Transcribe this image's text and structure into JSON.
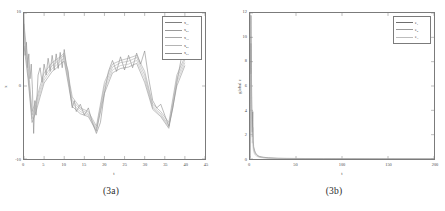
{
  "figure": {
    "panels": [
      {
        "id": "panel-3a",
        "caption": "(3a)",
        "chart_data": {
          "type": "line",
          "title": "",
          "xlabel": "t",
          "ylabel": "x",
          "xlim": [
            0,
            45
          ],
          "ylim": [
            -10,
            10
          ],
          "xticks": [
            0,
            5,
            10,
            15,
            20,
            25,
            30,
            35,
            40,
            45
          ],
          "xticklabels": [
            "0",
            "5",
            "10",
            "15",
            "20",
            "25",
            "30",
            "35",
            "40",
            "45"
          ],
          "yticks": [
            -10,
            0,
            10
          ],
          "yticklabels": [
            "-10",
            "0",
            "10"
          ],
          "grid": false,
          "legend_position": "upper right",
          "series": [
            {
              "name": "x_11",
              "label_base": "x",
              "label_sub": "11",
              "color": "#7f7f7f",
              "x": [
                0,
                0.3,
                0.6,
                0.9,
                1.2,
                1.5,
                1.8,
                2.1,
                2.4,
                2.7,
                3.0,
                3.5,
                4.0,
                4.5,
                5.0,
                5.5,
                6.0,
                6.5,
                7.0,
                7.5,
                8.0,
                8.5,
                9.0,
                9.5,
                10.0,
                10.5,
                11.0,
                11.5,
                12.0,
                12.5,
                13.0,
                14.0,
                15.0,
                16.0,
                17.0,
                18.0,
                19.0,
                20.0,
                21.0,
                22.0,
                23.0,
                24.0,
                25.0,
                26.0,
                27.0,
                28.0,
                29.0,
                30.0,
                31.0,
                32.0,
                33.0,
                34.0,
                35.0,
                36.0,
                37.0,
                38.0,
                39.0,
                40.0
              ],
              "y": [
                9.6,
                4.2,
                6.0,
                2.5,
                4.4,
                1.0,
                3.0,
                -0.5,
                -6.5,
                -2.0,
                -4.0,
                1.5,
                2.5,
                0.5,
                3.0,
                1.5,
                3.8,
                2.0,
                4.2,
                2.2,
                4.4,
                2.4,
                4.6,
                2.5,
                5.0,
                3.0,
                2.0,
                -1.0,
                -3.0,
                -2.0,
                -3.5,
                -2.5,
                -4.0,
                -3.0,
                -5.0,
                -6.5,
                -5.0,
                -1.0,
                2.0,
                3.5,
                2.0,
                4.0,
                2.2,
                4.2,
                2.5,
                4.5,
                3.0,
                4.8,
                1.0,
                -2.0,
                -3.0,
                -2.5,
                -4.0,
                -5.5,
                -3.0,
                0.5,
                3.5,
                4.2
              ]
            },
            {
              "name": "x_21",
              "label_base": "x",
              "label_sub": "21",
              "color": "#9a9a9a",
              "x": [
                0,
                1,
                2,
                3,
                4,
                5,
                6,
                7,
                8,
                9,
                10,
                12,
                14,
                16,
                18,
                20,
                22,
                24,
                26,
                28,
                30,
                32,
                34,
                36,
                38,
                40
              ],
              "y": [
                8.5,
                3.0,
                -3.5,
                -2.0,
                0.0,
                1.8,
                2.5,
                3.2,
                3.6,
                4.0,
                4.5,
                -1.5,
                -3.0,
                -3.5,
                -5.5,
                0.5,
                3.0,
                3.5,
                3.8,
                4.2,
                2.0,
                -2.5,
                -3.5,
                -5.0,
                1.5,
                4.0
              ]
            },
            {
              "name": "x_31",
              "label_base": "x",
              "label_sub": "31",
              "color": "#a8a8a8",
              "x": [
                0,
                1,
                2,
                3,
                4,
                5,
                6,
                7,
                8,
                9,
                10,
                12,
                14,
                16,
                18,
                20,
                22,
                24,
                26,
                28,
                30,
                32,
                34,
                36,
                38,
                40
              ],
              "y": [
                7.5,
                2.0,
                -4.0,
                -2.5,
                -0.5,
                1.2,
                2.0,
                2.8,
                3.2,
                3.8,
                4.2,
                -2.0,
                -3.2,
                -3.8,
                -5.8,
                0.0,
                2.6,
                3.2,
                3.4,
                3.9,
                1.5,
                -2.8,
                -3.8,
                -5.4,
                1.0,
                3.6
              ]
            },
            {
              "name": "x_41",
              "label_base": "x",
              "label_sub": "41",
              "color": "#b4b4b4",
              "x": [
                0,
                1,
                2,
                3,
                4,
                5,
                6,
                7,
                8,
                9,
                10,
                12,
                14,
                16,
                18,
                20,
                22,
                24,
                26,
                28,
                30,
                32,
                34,
                36,
                38,
                40
              ],
              "y": [
                6.5,
                1.5,
                -4.5,
                -3.0,
                -1.0,
                0.8,
                1.6,
                2.4,
                2.8,
                3.4,
                3.8,
                -2.4,
                -3.5,
                -4.0,
                -6.0,
                -0.5,
                2.2,
                2.8,
                3.0,
                3.5,
                1.0,
                -3.0,
                -4.0,
                -5.6,
                0.5,
                3.2
              ]
            },
            {
              "name": "x_51",
              "label_base": "x",
              "label_sub": "51",
              "color": "#8c8c8c",
              "x": [
                0,
                1,
                2,
                3,
                4,
                5,
                6,
                7,
                8,
                9,
                10,
                12,
                14,
                16,
                18,
                20,
                22,
                24,
                26,
                28,
                30,
                32,
                34,
                36,
                38,
                40
              ],
              "y": [
                5.5,
                1.0,
                -5.0,
                -3.5,
                -1.5,
                0.4,
                1.2,
                2.0,
                2.4,
                3.0,
                3.4,
                -2.8,
                -3.8,
                -4.2,
                -6.2,
                -1.0,
                1.8,
                2.4,
                2.6,
                3.1,
                0.5,
                -3.2,
                -4.2,
                -5.8,
                0.0,
                2.8
              ]
            }
          ]
        }
      },
      {
        "id": "panel-3b",
        "caption": "(3b)",
        "chart_data": {
          "type": "line",
          "title": "",
          "xlabel": "t",
          "ylabel": "global e",
          "xlim": [
            0,
            200
          ],
          "ylim": [
            0,
            12
          ],
          "xticks": [
            0,
            50,
            100,
            150,
            200
          ],
          "xticklabels": [
            "0",
            "50",
            "100",
            "150",
            "200"
          ],
          "yticks": [
            0,
            2,
            4,
            6,
            8,
            10,
            12
          ],
          "yticklabels": [
            "0",
            "2",
            "4",
            "6",
            "8",
            "10",
            "12"
          ],
          "grid": false,
          "legend_position": "upper right",
          "series": [
            {
              "name": "e_1",
              "label_base": "e",
              "label_sub": "1",
              "color": "#6e6e6e",
              "x": [
                0,
                0.5,
                1,
                1.5,
                2,
                2.5,
                3,
                3.5,
                4,
                5,
                6,
                7,
                8,
                10,
                12,
                15,
                20,
                25,
                30,
                40,
                60,
                80,
                100,
                130,
                160,
                200
              ],
              "y": [
                0.1,
                6.0,
                11.8,
                7.5,
                4.0,
                2.2,
                3.9,
                1.5,
                1.0,
                0.7,
                0.5,
                0.4,
                0.3,
                0.22,
                0.18,
                0.14,
                0.1,
                0.08,
                0.06,
                0.05,
                0.04,
                0.03,
                0.03,
                0.02,
                0.02,
                0.02
              ]
            },
            {
              "name": "e_2",
              "label_base": "e",
              "label_sub": "2",
              "color": "#9b9b9b",
              "x": [
                0,
                0.5,
                1,
                1.5,
                2,
                2.5,
                3,
                3.5,
                4,
                5,
                6,
                7,
                8,
                10,
                12,
                15,
                20,
                25,
                30,
                40,
                60,
                80,
                100,
                130,
                160,
                200
              ],
              "y": [
                0.1,
                4.5,
                9.5,
                6.0,
                3.2,
                1.8,
                2.6,
                1.1,
                0.8,
                0.55,
                0.4,
                0.32,
                0.25,
                0.18,
                0.14,
                0.11,
                0.08,
                0.06,
                0.05,
                0.04,
                0.03,
                0.025,
                0.02,
                0.02,
                0.015,
                0.015
              ]
            },
            {
              "name": "e_3",
              "label_base": "e",
              "label_sub": "3",
              "color": "#bdbdbd",
              "x": [
                0,
                0.5,
                1,
                1.5,
                2,
                2.5,
                3,
                3.5,
                4,
                5,
                6,
                7,
                8,
                10,
                12,
                15,
                20,
                25,
                30,
                40,
                60,
                80,
                100,
                130,
                160,
                200
              ],
              "y": [
                0.1,
                3.0,
                7.0,
                4.2,
                2.4,
                1.3,
                1.8,
                0.8,
                0.6,
                0.4,
                0.3,
                0.24,
                0.2,
                0.14,
                0.11,
                0.09,
                0.06,
                0.05,
                0.04,
                0.03,
                0.025,
                0.02,
                0.018,
                0.015,
                0.012,
                0.012
              ]
            }
          ]
        }
      }
    ]
  }
}
